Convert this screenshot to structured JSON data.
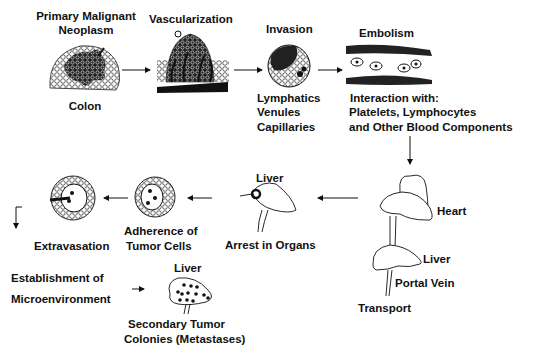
{
  "diagram": {
    "steps": [
      {
        "id": "primary",
        "title_line1": "Primary Malignant",
        "title_line2": "Neoplasm",
        "caption": "Colon"
      },
      {
        "id": "vascularization",
        "title": "Vascularization"
      },
      {
        "id": "invasion",
        "title": "Invasion",
        "caption_lines": [
          "Lymphatics",
          "Venules",
          "Capillaries"
        ]
      },
      {
        "id": "embolism",
        "title": "Embolism",
        "caption_lines": [
          "Interaction with:",
          "Platelets, Lymphocytes",
          "and Other Blood Components"
        ]
      },
      {
        "id": "transport",
        "labels": {
          "heart": "Heart",
          "liver": "Liver",
          "portal_vein": "Portal Vein",
          "transport": "Transport"
        }
      },
      {
        "id": "arrest",
        "organ": "Liver",
        "caption": "Arrest in Organs"
      },
      {
        "id": "adherence",
        "caption_line1": "Adherence of",
        "caption_line2": "Tumor Cells"
      },
      {
        "id": "extravasation",
        "caption": "Extravasation"
      },
      {
        "id": "microenvironment",
        "caption_line1": "Establishment of",
        "caption_line2": "Microenvironment"
      },
      {
        "id": "metastases",
        "organ": "Liver",
        "caption_line1": "Secondary Tumor",
        "caption_line2": "Colonies (Metastases)"
      }
    ],
    "colors": {
      "ink": "#111111",
      "background": "#ffffff"
    }
  }
}
